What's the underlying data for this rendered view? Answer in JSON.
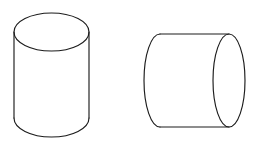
{
  "figure": {
    "title": "Two cylinders line drawing",
    "background_color": "#ffffff",
    "stroke_color": "#1c1c1c",
    "stroke_width": 1.15,
    "canvas": {
      "width": 263,
      "height": 149
    },
    "shapes": [
      {
        "id": "left-cylinder",
        "name": "upright-cylinder",
        "orientation": "vertical",
        "description": "Upright circular cylinder drawn in oblique projection with visible elliptical top face",
        "geometry": {
          "top_ellipse": {
            "cx": 51.5,
            "cy": 32.0,
            "rx": 37.5,
            "ry": 19.0
          },
          "left_wall_x": 14.0,
          "right_wall_x": 89.0,
          "body_top_y": 32.0,
          "body_bottom_y": 118.0,
          "bottom_arc_bulge_y": 137.0
        }
      },
      {
        "id": "right-cylinder",
        "name": "lying-cylinder",
        "orientation": "horizontal",
        "description": "Cylinder lying on its side with visible elliptical right end face and curved left cap",
        "geometry": {
          "right_ellipse": {
            "cx": 229.0,
            "cy": 80.5,
            "rx": 16.0,
            "ry": 46.5
          },
          "top_wall_y": 34.0,
          "bottom_wall_y": 127.0,
          "body_left_x": 160.0,
          "body_right_x": 229.0,
          "left_cap_bulge_x": 144.0
        }
      }
    ]
  }
}
